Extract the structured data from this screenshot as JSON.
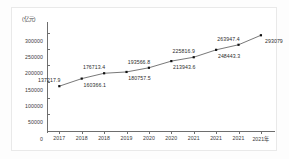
{
  "chart_data": {
    "type": "line",
    "title": "",
    "subtitle": "",
    "xlabel": "",
    "ylabel": "(亿元)",
    "unit_label": "(亿元)",
    "categories": [
      "2017",
      "2018",
      "2018",
      "2019",
      "2020",
      "2020",
      "2021",
      "2021",
      "2021",
      "2021年"
    ],
    "values": [
      137217.9,
      160366.1,
      176713.4,
      180757.5,
      193566.8,
      213943.6,
      225816.9,
      248443.3,
      263947.4,
      293079
    ],
    "point_labels": [
      "137217.9",
      "160366.1",
      "176713.4",
      "180757.5",
      "193566.8",
      "213943.6",
      "225816.9",
      "248443.3",
      "263947.4",
      "293079"
    ],
    "ytick_labels": [
      "0",
      "50000",
      "100000",
      "150000",
      "200000",
      "250000",
      "300000"
    ],
    "ytick_values": [
      0,
      50000,
      100000,
      150000,
      200000,
      250000,
      300000
    ],
    "ylim": [
      0,
      325000
    ],
    "grid": false,
    "legend": null,
    "legend_position": "none",
    "marker": "square",
    "line_color": "#555555",
    "marker_color": "#111111",
    "axis_color": "#6e6e6e",
    "text_color": "#2c2c2c",
    "background_color": "#ffffff",
    "label_offsets": [
      "above-left",
      "below-right",
      "above-left",
      "below-right",
      "above-left",
      "below-right",
      "above-left",
      "below-right",
      "above-left",
      "below-right"
    ]
  }
}
